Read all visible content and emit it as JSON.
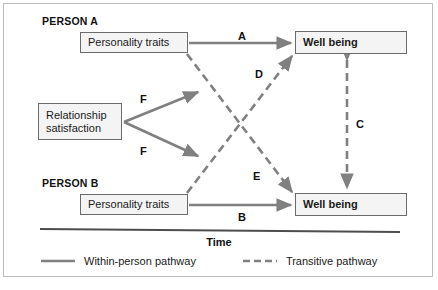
{
  "figure": {
    "groups": [
      {
        "id": "person_a",
        "label": "PERSON A"
      },
      {
        "id": "person_b",
        "label": "PERSON B"
      }
    ],
    "nodes": [
      {
        "id": "pa_traits",
        "label": "Personality traits"
      },
      {
        "id": "pa_well",
        "label": "Well being"
      },
      {
        "id": "rel_sat",
        "line1": "Relationship",
        "line2": "satisfaction"
      },
      {
        "id": "pb_traits",
        "label": "Personality traits"
      },
      {
        "id": "pb_well",
        "label": "Well being"
      }
    ],
    "path_labels": {
      "a": "A",
      "b": "B",
      "c": "C",
      "d": "D",
      "e": "E",
      "f_upper": "F",
      "f_lower": "F"
    },
    "axis": {
      "time_label": "Time"
    },
    "legend": [
      {
        "id": "within_person",
        "style": "solid",
        "label": "Within-person pathway"
      },
      {
        "id": "transitive",
        "style": "dashed",
        "label": "Transitive pathway"
      }
    ],
    "colors": {
      "pathway_gray": "#808080",
      "box_border": "#6b6b6b",
      "box_fill": "#f4f4f4",
      "text": "#111111",
      "frame_border": "#bdbdbd",
      "time_axis": "#4d4d4d"
    }
  }
}
